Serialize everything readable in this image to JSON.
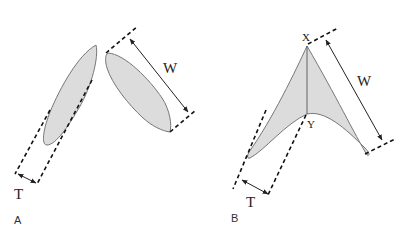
{
  "figure": {
    "panels": [
      {
        "id": "A",
        "label": "A",
        "width_label": "W",
        "thickness_label": "T"
      },
      {
        "id": "B",
        "label": "B",
        "width_label": "W",
        "thickness_label": "T",
        "apex_label": "X",
        "inner_vertex_label": "Y"
      }
    ],
    "colors": {
      "fill": "#dcdcdc",
      "outline": "#777777",
      "lines": "#111111"
    }
  }
}
